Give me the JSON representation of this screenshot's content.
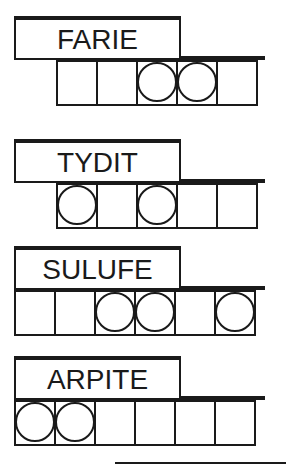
{
  "game": {
    "type": "word-jumble",
    "colors": {
      "ink": "#1a1a1a",
      "background": "#ffffff"
    },
    "puzzles": [
      {
        "scrambled": "FARIE",
        "tile_count": 5,
        "tiles_offset": 1,
        "circled_positions": [
          3,
          4
        ],
        "tiles": [
          {
            "circled": false,
            "value": ""
          },
          {
            "circled": false,
            "value": ""
          },
          {
            "circled": true,
            "value": ""
          },
          {
            "circled": true,
            "value": ""
          },
          {
            "circled": false,
            "value": ""
          }
        ]
      },
      {
        "scrambled": "TYDIT",
        "tile_count": 5,
        "tiles_offset": 1,
        "circled_positions": [
          1,
          3
        ],
        "tiles": [
          {
            "circled": true,
            "value": ""
          },
          {
            "circled": false,
            "value": ""
          },
          {
            "circled": true,
            "value": ""
          },
          {
            "circled": false,
            "value": ""
          },
          {
            "circled": false,
            "value": ""
          }
        ]
      },
      {
        "scrambled": "SULUFE",
        "tile_count": 6,
        "tiles_offset": 0,
        "circled_positions": [
          3,
          4,
          6
        ],
        "tiles": [
          {
            "circled": false,
            "value": ""
          },
          {
            "circled": false,
            "value": ""
          },
          {
            "circled": true,
            "value": ""
          },
          {
            "circled": true,
            "value": ""
          },
          {
            "circled": false,
            "value": ""
          },
          {
            "circled": true,
            "value": ""
          }
        ]
      },
      {
        "scrambled": "ARPITE",
        "tile_count": 6,
        "tiles_offset": 0,
        "circled_positions": [
          1,
          2
        ],
        "tiles": [
          {
            "circled": true,
            "value": ""
          },
          {
            "circled": true,
            "value": ""
          },
          {
            "circled": false,
            "value": ""
          },
          {
            "circled": false,
            "value": ""
          },
          {
            "circled": false,
            "value": ""
          },
          {
            "circled": false,
            "value": ""
          }
        ]
      }
    ]
  }
}
